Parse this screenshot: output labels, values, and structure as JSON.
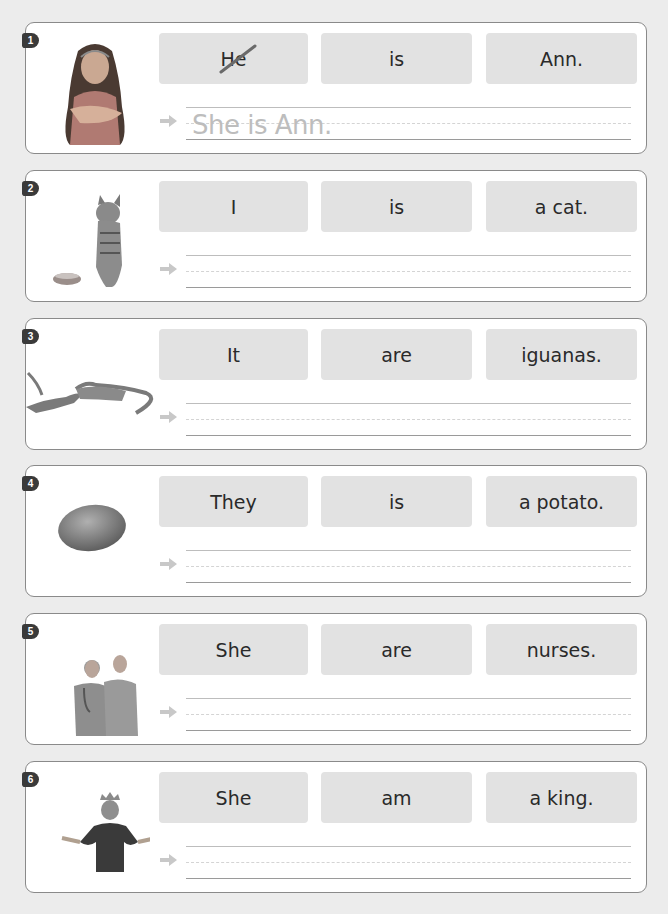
{
  "exercises": [
    {
      "number": "1",
      "image": "girl-photo",
      "words": [
        "He",
        "is",
        "Ann."
      ],
      "crossed_word_index": 0,
      "answer": "She is Ann."
    },
    {
      "number": "2",
      "image": "cat-photo",
      "words": [
        "I",
        "is",
        "a cat."
      ],
      "answer": ""
    },
    {
      "number": "3",
      "image": "iguanas-photo",
      "words": [
        "It",
        "are",
        "iguanas."
      ],
      "answer": ""
    },
    {
      "number": "4",
      "image": "potato-photo",
      "words": [
        "They",
        "is",
        "a potato."
      ],
      "answer": ""
    },
    {
      "number": "5",
      "image": "nurses-photo",
      "words": [
        "She",
        "are",
        "nurses."
      ],
      "answer": ""
    },
    {
      "number": "6",
      "image": "king-photo",
      "words": [
        "She",
        "am",
        "a king."
      ],
      "answer": ""
    }
  ],
  "colors": {
    "box": "#e2e2e2",
    "answer_text": "#bdbdbd",
    "badge": "#3a3a3a",
    "background": "#ececec"
  }
}
